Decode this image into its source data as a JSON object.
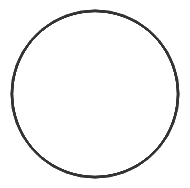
{
  "figure": {
    "center": [
      95,
      94
    ],
    "outer_radius": 84,
    "copies": 18,
    "rotation_step_deg": 20,
    "stroke_color": "#333333",
    "background_color": "#ffffff"
  }
}
